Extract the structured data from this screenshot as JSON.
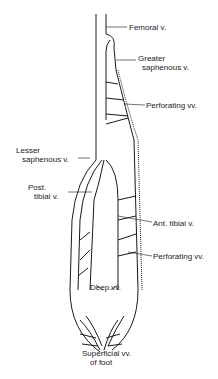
{
  "diagram": {
    "labels": {
      "femoral": "Femoral v.",
      "greater_saphenous_1": "Greater",
      "greater_saphenous_2": "saphenous v.",
      "perforating_upper": "Perforating vv.",
      "lesser_saphenous_1": "Lesser",
      "lesser_saphenous_2": "saphenous v.",
      "post_tibial_1": "Post.",
      "post_tibial_2": "tibial v.",
      "ant_tibial": "Ant. tibial v.",
      "perforating_lower": "Perforating vv.",
      "deep": "Deep vv.",
      "superficial_foot_1": "Superficial vv.",
      "superficial_foot_2": "of foot"
    },
    "colors": {
      "line": "#1a1a1a",
      "background": "#ffffff"
    }
  }
}
